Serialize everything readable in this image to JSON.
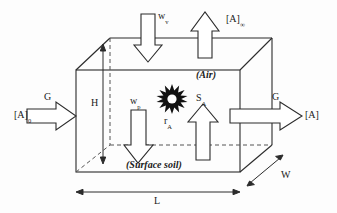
{
  "figure": {
    "type": "diagram",
    "background_color": "#fdfdfd",
    "line_color": "#2b2b2b",
    "dashed_color": "#555555"
  },
  "box": {
    "region_air_label": "(Air)",
    "region_soil_label": "(Surface soil)"
  },
  "dimensions": [
    {
      "name": "height",
      "label": "H"
    },
    {
      "name": "length",
      "label": "L"
    },
    {
      "name": "width",
      "label": "W"
    }
  ],
  "flows": {
    "inflow": {
      "flux_label": "G",
      "concentration_label": "[A]",
      "concentration_sub": "0",
      "direction": "right"
    },
    "outflow": {
      "flux_label": "G",
      "concentration_label": "[A]",
      "concentration_sub": "",
      "direction": "right"
    },
    "top_out": {
      "concentration_label": "[A]",
      "concentration_sub": "∞",
      "direction": "up"
    },
    "vapor_deposition": {
      "label": "w",
      "sub": "v",
      "direction": "down"
    },
    "particle_deposition": {
      "label": "w",
      "sub": "p",
      "direction": "down"
    },
    "soil_source": {
      "label": "S",
      "sub": "A",
      "direction": "up"
    },
    "reaction": {
      "label": "r",
      "sub": "A",
      "icon": "sun-burst-icon"
    }
  }
}
